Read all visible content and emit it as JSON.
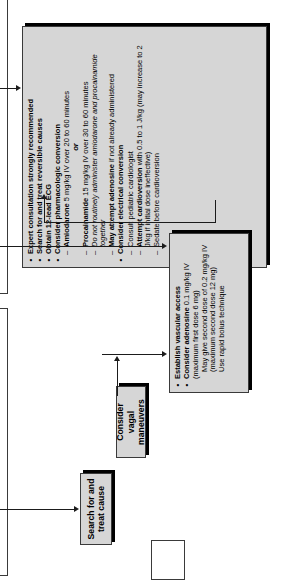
{
  "page": {
    "orientation": "rotated-90-ccw",
    "background": "#ffffff",
    "box_fill": "#d6d6d6",
    "line_color": "#1b1b1b"
  },
  "boxes": {
    "expert": {
      "name": "expert-consultation-box",
      "items": [
        {
          "type": "bullet",
          "text": "Expert consultation strongly recommended"
        },
        {
          "type": "bullet",
          "text": "Search for and treat reversible causes"
        },
        {
          "type": "bullet",
          "text": "Obtain 12-lead ECG"
        },
        {
          "type": "bullet",
          "text": "Consider pharmacologic conversion"
        },
        {
          "type": "dash",
          "lead": "Amiodarone",
          "rest": " 5 mg/kg IV over 20 to 60 minutes"
        },
        {
          "type": "or",
          "text": "or"
        },
        {
          "type": "dash",
          "lead": "Procainamide",
          "rest": " 15 mg/kg IV over 30 to 60 minutes"
        },
        {
          "type": "dash-italic",
          "text": "Do not routinely administer amiodarone and procainamide together"
        },
        {
          "type": "dash",
          "lead": "May attempt adenosine",
          "rest": " if not already administered"
        },
        {
          "type": "bullet",
          "text": "Consider electrical conversion"
        },
        {
          "type": "dash",
          "text": "Consult pediatric cardiologist"
        },
        {
          "type": "dash",
          "lead": "Attempt cardioversion",
          "rest": " with 0.5 to 1 J/kg (may increase to 2 J/kg if initial dose ineffective)"
        },
        {
          "type": "dash",
          "text": "Sedate before cardioversion"
        }
      ]
    },
    "adenosine": {
      "name": "adenosine-box",
      "items": [
        {
          "type": "bullet",
          "text": "Establish vascular access"
        },
        {
          "type": "bullet",
          "lead": "Consider adenosine",
          "rest": " 0.1 mg/kg IV (maximum first dose 6 mg)"
        },
        {
          "type": "plainb",
          "text": "May give second dose of 0.2 mg/kg IV (maximum second dose 12 mg)"
        },
        {
          "type": "plainb",
          "text": "Use rapid bolus technique"
        }
      ]
    },
    "vagal": {
      "name": "vagal-maneuvers-box",
      "title": "Consider vagal maneuvers"
    },
    "search": {
      "name": "search-treat-cause-box",
      "title": "Search for and treat cause"
    }
  },
  "connectors": [
    {
      "name": "connector-into-expert-left",
      "kind": "arrow-right"
    },
    {
      "name": "connector-adenosine-to-expert",
      "kind": "arrow-up"
    },
    {
      "name": "connector-into-adenosine-left",
      "kind": "arrow-right"
    },
    {
      "name": "connector-vagal-to-adenosine",
      "kind": "arrow-up"
    },
    {
      "name": "connector-into-search-left",
      "kind": "arrow-right"
    }
  ]
}
